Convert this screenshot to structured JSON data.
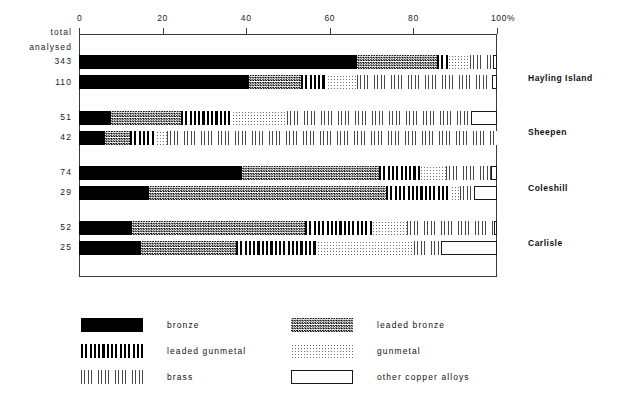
{
  "chart_data": {
    "type": "bar",
    "subtype": "horizontal-stacked-percentage",
    "title": "",
    "xlabel": "100%",
    "ylabel": "",
    "xlim": [
      0,
      100
    ],
    "x_ticks": [
      0,
      20,
      40,
      60,
      80,
      100
    ],
    "x_tick_labels": [
      "0",
      "20",
      "40",
      "60",
      "80",
      "100%"
    ],
    "grid": false,
    "legend_position": "below-plot",
    "row_header": [
      "total",
      "analysed"
    ],
    "series": [
      {
        "name": "bronze",
        "key": "bronze",
        "pattern": "solid-black",
        "color": "#000000"
      },
      {
        "name": "leaded bronze",
        "key": "leaded_bronze",
        "pattern": "dense-checker",
        "color": "#000000"
      },
      {
        "name": "leaded gunmetal",
        "key": "leaded_gunmetal",
        "pattern": "thick-vertical",
        "color": "#000000"
      },
      {
        "name": "gunmetal",
        "key": "gunmetal",
        "pattern": "fine-stipple",
        "color": "#6f6f6f"
      },
      {
        "name": "brass",
        "key": "brass",
        "pattern": "thin-vertical",
        "color": "#4a4a4a"
      },
      {
        "name": "other copper alloys",
        "key": "other",
        "pattern": "open-outline",
        "color": "#ffffff"
      }
    ],
    "groups": [
      {
        "site": "Hayling Island",
        "rows": [
          {
            "total": "343",
            "values": {
              "bronze": 66.5,
              "leaded_bronze": 19.1,
              "leaded_gunmetal": 2.6,
              "gunmetal": 5.3,
              "brass": 5.5,
              "other": 1.0
            }
          },
          {
            "total": "110",
            "values": {
              "bronze": 40.7,
              "leaded_bronze": 12.4,
              "leaded_gunmetal": 6.2,
              "gunmetal": 7.2,
              "brass": 32.3,
              "other": 1.2
            }
          }
        ]
      },
      {
        "site": "Sheepen",
        "rows": [
          {
            "total": "51",
            "values": {
              "bronze": 7.7,
              "leaded_bronze": 16.7,
              "leaded_gunmetal": 12.2,
              "gunmetal": 13.2,
              "brass": 44.0,
              "other": 6.2
            }
          },
          {
            "total": "42",
            "values": {
              "bronze": 6.2,
              "leaded_bronze": 6.0,
              "leaded_gunmetal": 6.2,
              "gunmetal": 2.7,
              "brass": 78.9,
              "other": 0.0
            }
          }
        ]
      },
      {
        "site": "Coleshill",
        "rows": [
          {
            "total": "74",
            "values": {
              "bronze": 39.0,
              "leaded_bronze": 32.8,
              "leaded_gunmetal": 9.8,
              "gunmetal": 6.2,
              "brass": 10.8,
              "other": 1.4
            }
          },
          {
            "total": "29",
            "values": {
              "bronze": 16.7,
              "leaded_bronze": 56.7,
              "leaded_gunmetal": 15.6,
              "gunmetal": 2.2,
              "brass": 3.3,
              "other": 5.5
            }
          }
        ]
      },
      {
        "site": "Carlisle",
        "rows": [
          {
            "total": "52",
            "values": {
              "bronze": 12.7,
              "leaded_bronze": 41.4,
              "leaded_gunmetal": 16.0,
              "gunmetal": 8.4,
              "brass": 20.8,
              "other": 0.7
            }
          },
          {
            "total": "25",
            "values": {
              "bronze": 14.8,
              "leaded_bronze": 22.7,
              "leaded_gunmetal": 19.4,
              "gunmetal": 23.2,
              "brass": 6.5,
              "other": 13.4
            }
          }
        ]
      }
    ]
  },
  "axis": {
    "ticks": [
      {
        "value": 0,
        "label": "0"
      },
      {
        "value": 20,
        "label": "20"
      },
      {
        "value": 40,
        "label": "40"
      },
      {
        "value": 60,
        "label": "60"
      },
      {
        "value": 80,
        "label": "80"
      },
      {
        "value": 100,
        "label": "100%"
      }
    ]
  },
  "row_header": {
    "line1": "total",
    "line2": "analysed"
  },
  "row_totals": [
    "343",
    "110",
    "51",
    "42",
    "74",
    "29",
    "52",
    "25"
  ],
  "site_labels": [
    "Hayling Island",
    "Sheepen",
    "Coleshill",
    "Carlisle"
  ],
  "legend": {
    "items": [
      {
        "label": "bronze",
        "pattern": "solid-black"
      },
      {
        "label": "leaded bronze",
        "pattern": "dense-checker"
      },
      {
        "label": "leaded gunmetal",
        "pattern": "thick-vertical"
      },
      {
        "label": "gunmetal",
        "pattern": "fine-stipple"
      },
      {
        "label": "brass",
        "pattern": "thin-vertical"
      },
      {
        "label": "other copper alloys",
        "pattern": "open-outline"
      }
    ]
  }
}
